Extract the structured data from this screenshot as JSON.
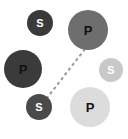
{
  "diagram": {
    "background_color": "#ffffff",
    "width": 128,
    "height": 139,
    "nodes": [
      {
        "id": "s-top-left",
        "label": "S",
        "type": "S",
        "cx": 40,
        "cy": 23,
        "r": 13,
        "fill": "#3a3a3a",
        "text_color": "#ffffff",
        "font_size": 11
      },
      {
        "id": "p-top-right",
        "label": "P",
        "type": "P",
        "cx": 88,
        "cy": 30,
        "r": 20,
        "fill": "#6e6e6e",
        "text_color": "#111111",
        "font_size": 13
      },
      {
        "id": "p-left",
        "label": "P",
        "type": "P",
        "cx": 23,
        "cy": 69,
        "r": 19,
        "fill": "#3b3b3b",
        "text_color": "#111111",
        "font_size": 13
      },
      {
        "id": "s-right",
        "label": "S",
        "type": "S",
        "cx": 111,
        "cy": 70,
        "r": 12,
        "fill": "#c8c8c8",
        "text_color": "#ffffff",
        "font_size": 11
      },
      {
        "id": "s-bottom-left",
        "label": "S",
        "type": "S",
        "cx": 39,
        "cy": 107,
        "r": 13,
        "fill": "#4a4a4a",
        "text_color": "#ffffff",
        "font_size": 11
      },
      {
        "id": "p-bottom",
        "label": "P",
        "type": "P",
        "cx": 90,
        "cy": 107,
        "r": 20,
        "fill": "#dcdcdc",
        "text_color": "#111111",
        "font_size": 13
      }
    ],
    "connectors": [
      {
        "id": "connector-p-top-right-to-s-bottom-left",
        "from": "p-top-right",
        "to": "s-bottom-left",
        "x1": 85,
        "y1": 49,
        "x2": 47,
        "y2": 98,
        "color": "#9a9a9a",
        "width": 2,
        "dash": "3 3",
        "style": "dashed"
      }
    ]
  }
}
